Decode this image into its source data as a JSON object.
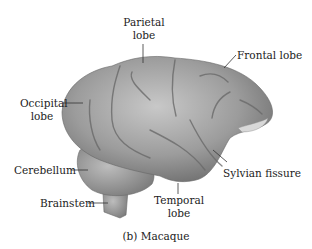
{
  "figure": {
    "caption": "(b) Macaque",
    "colors": {
      "brain_fill": "#9a9a9a",
      "brain_light": "#c4c4c4",
      "brain_dark": "#6e6e6e",
      "label_text": "#222222",
      "leader_line": "#333333"
    },
    "labels": {
      "parietal_1": "Parietal",
      "parietal_2": "lobe",
      "frontal": "Frontal lobe",
      "occipital_1": "Occipital",
      "occipital_2": "lobe",
      "cerebellum": "Cerebellum",
      "sylvian": "Sylvian fissure",
      "brainstem": "Brainstem",
      "temporal_1": "Temporal",
      "temporal_2": "lobe"
    }
  }
}
